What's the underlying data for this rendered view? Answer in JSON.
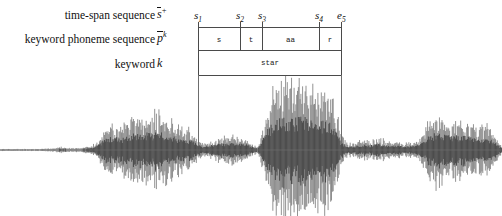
{
  "figure": {
    "type": "speech-waveform-annotation",
    "keyword": "star"
  },
  "rows": [
    {
      "id": "time-span-sequence",
      "label": "time-span sequence",
      "symbol_base": "s",
      "symbol_sup": "+"
    },
    {
      "id": "keyword-phoneme-sequence",
      "label": "keyword phoneme sequence",
      "symbol_base": "p",
      "symbol_sup": "k"
    },
    {
      "id": "keyword",
      "label": "keyword",
      "symbol_base": "k",
      "symbol_sup": ""
    }
  ],
  "axis": {
    "ticks": [
      {
        "id": "s1",
        "base": "s",
        "sub": "1",
        "x": 198
      },
      {
        "id": "s2",
        "base": "s",
        "sub": "2",
        "x": 240
      },
      {
        "id": "s3",
        "base": "s",
        "sub": "3",
        "x": 262
      },
      {
        "id": "s4",
        "base": "s",
        "sub": "4",
        "x": 319
      },
      {
        "id": "e5",
        "base": "e",
        "sub": "5",
        "x": 341
      }
    ]
  },
  "phoneme_cells": [
    {
      "id": "phoneme-s",
      "text": "s",
      "x0": 198,
      "x1": 240
    },
    {
      "id": "phoneme-t",
      "text": "t",
      "x0": 240,
      "x1": 262
    },
    {
      "id": "phoneme-aa",
      "text": "aa",
      "x0": 262,
      "x1": 319
    },
    {
      "id": "phoneme-r",
      "text": "r",
      "x0": 319,
      "x1": 341
    }
  ],
  "keyword_cell": {
    "id": "keyword-star",
    "text": "star",
    "x0": 198,
    "x1": 341
  },
  "colors": {
    "background": "#ffffff",
    "text": "#111111",
    "rule": "#4a4a4a",
    "boundary": "#6d6d6d",
    "waveform": "#6f6f6f",
    "waveform_core": "#4a4a4a"
  },
  "chart_data": {
    "type": "line",
    "title": "",
    "xlabel": "",
    "ylabel": "",
    "grid": false,
    "legend": null,
    "baseline_y": 150,
    "segment_boundaries_px": [
      198,
      341
    ],
    "envelope": {
      "x_px": [
        0,
        20,
        40,
        55,
        62,
        68,
        74,
        80,
        86,
        92,
        98,
        104,
        110,
        116,
        122,
        128,
        134,
        140,
        146,
        152,
        158,
        164,
        170,
        176,
        182,
        188,
        194,
        198,
        204,
        210,
        216,
        222,
        228,
        234,
        240,
        246,
        252,
        258,
        264,
        270,
        276,
        282,
        288,
        294,
        300,
        306,
        312,
        318,
        324,
        330,
        336,
        341,
        348,
        356,
        364,
        372,
        380,
        388,
        396,
        404,
        412,
        420,
        428,
        436,
        444,
        452,
        460,
        468,
        476,
        484,
        492,
        500
      ],
      "amplitude_px": [
        1,
        1,
        1,
        2,
        3,
        2,
        2,
        2,
        3,
        4,
        9,
        18,
        24,
        26,
        22,
        26,
        30,
        28,
        32,
        30,
        34,
        30,
        26,
        24,
        22,
        20,
        16,
        10,
        6,
        8,
        11,
        12,
        13,
        13,
        12,
        11,
        6,
        3,
        24,
        46,
        58,
        62,
        60,
        58,
        62,
        60,
        56,
        58,
        54,
        50,
        44,
        14,
        6,
        8,
        10,
        9,
        12,
        8,
        9,
        7,
        8,
        10,
        26,
        32,
        28,
        26,
        27,
        25,
        26,
        22,
        18,
        6
      ]
    }
  }
}
